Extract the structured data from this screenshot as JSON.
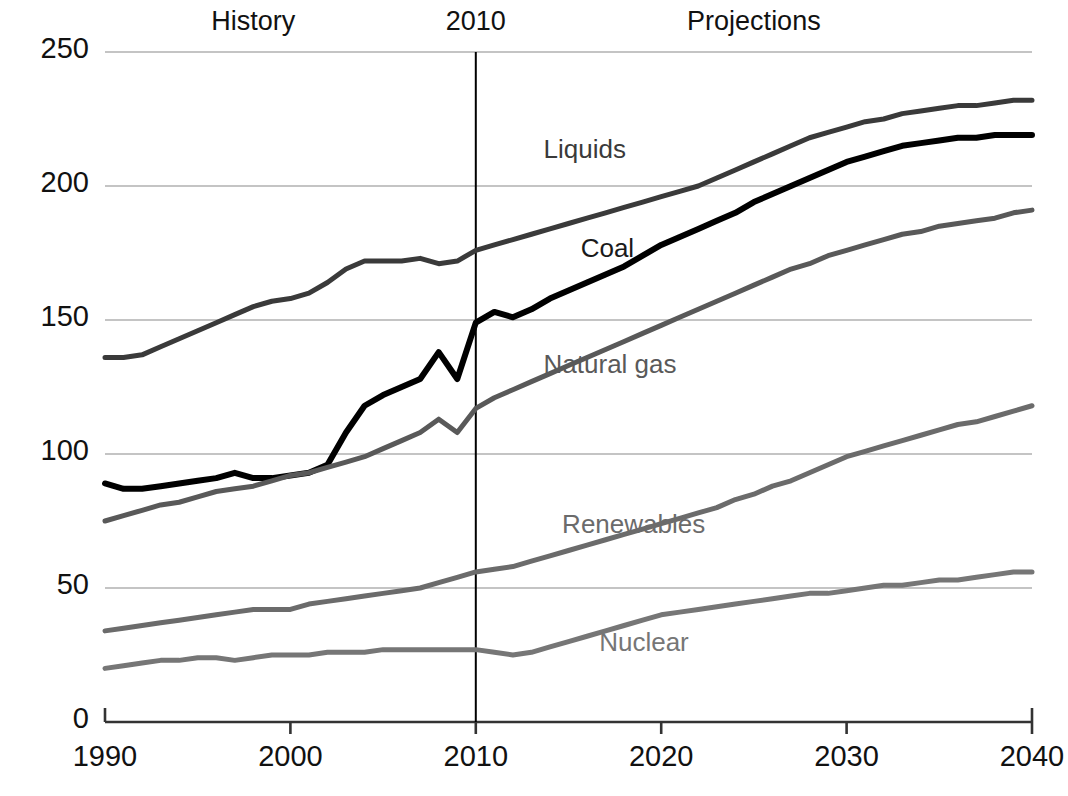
{
  "chart_data": {
    "type": "line",
    "title": "",
    "xlabel": "",
    "ylabel": "",
    "xlim": [
      1990,
      2040
    ],
    "ylim": [
      0,
      250
    ],
    "grid": true,
    "legend_position": "inline-labels",
    "xticks": [
      "1990",
      "2000",
      "2010",
      "2020",
      "2030",
      "2040"
    ],
    "yticks": [
      "0",
      "50",
      "100",
      "150",
      "200",
      "250"
    ],
    "annotations": [
      {
        "name": "history",
        "text": "History",
        "x": 1998
      },
      {
        "name": "divider-year",
        "text": "2010",
        "x": 2010
      },
      {
        "name": "projections",
        "text": "Projections",
        "x": 2025
      }
    ],
    "divider_x": 2010,
    "x": [
      1990,
      1991,
      1992,
      1993,
      1994,
      1995,
      1996,
      1997,
      1998,
      1999,
      2000,
      2001,
      2002,
      2003,
      2004,
      2005,
      2006,
      2007,
      2008,
      2009,
      2010,
      2011,
      2012,
      2013,
      2014,
      2015,
      2016,
      2017,
      2018,
      2019,
      2020,
      2021,
      2022,
      2023,
      2024,
      2025,
      2026,
      2027,
      2028,
      2029,
      2030,
      2031,
      2032,
      2033,
      2034,
      2035,
      2036,
      2037,
      2038,
      2039,
      2040
    ],
    "series": [
      {
        "name": "Liquids",
        "color": "#3a3a3a",
        "width": 5,
        "label_x": 2017,
        "label_y": 213,
        "values": [
          136,
          136,
          137,
          140,
          143,
          146,
          149,
          152,
          155,
          157,
          158,
          160,
          164,
          169,
          172,
          172,
          172,
          173,
          171,
          172,
          176,
          178,
          180,
          182,
          184,
          186,
          188,
          190,
          192,
          194,
          196,
          198,
          200,
          203,
          206,
          209,
          212,
          215,
          218,
          220,
          222,
          224,
          225,
          227,
          228,
          229,
          230,
          230,
          231,
          232,
          232
        ]
      },
      {
        "name": "Coal",
        "color": "#000000",
        "width": 6,
        "label_x": 2019,
        "label_y": 176,
        "values": [
          89,
          87,
          87,
          88,
          89,
          90,
          91,
          93,
          91,
          91,
          92,
          93,
          96,
          108,
          118,
          122,
          125,
          128,
          138,
          128,
          149,
          153,
          151,
          154,
          158,
          161,
          164,
          167,
          170,
          174,
          178,
          181,
          184,
          187,
          190,
          194,
          197,
          200,
          203,
          206,
          209,
          211,
          213,
          215,
          216,
          217,
          218,
          218,
          219,
          219,
          219
        ]
      },
      {
        "name": "Natural gas",
        "color": "#595959",
        "width": 5,
        "label_x": 2017,
        "label_y": 133,
        "values": [
          75,
          77,
          79,
          81,
          82,
          84,
          86,
          87,
          88,
          90,
          92,
          93,
          95,
          97,
          99,
          102,
          105,
          108,
          113,
          108,
          117,
          121,
          124,
          127,
          130,
          133,
          136,
          139,
          142,
          145,
          148,
          151,
          154,
          157,
          160,
          163,
          166,
          169,
          171,
          174,
          176,
          178,
          180,
          182,
          183,
          185,
          186,
          187,
          188,
          190,
          191
        ]
      },
      {
        "name": "Renewables",
        "color": "#6b6b6b",
        "width": 5,
        "label_x": 2018,
        "label_y": 73,
        "values": [
          34,
          35,
          36,
          37,
          38,
          39,
          40,
          41,
          42,
          42,
          42,
          44,
          45,
          46,
          47,
          48,
          49,
          50,
          52,
          54,
          56,
          57,
          58,
          60,
          62,
          64,
          66,
          68,
          70,
          72,
          74,
          76,
          78,
          80,
          83,
          85,
          88,
          90,
          93,
          96,
          99,
          101,
          103,
          105,
          107,
          109,
          111,
          112,
          114,
          116,
          118
        ]
      },
      {
        "name": "Nuclear",
        "color": "#767676",
        "width": 5,
        "label_x": 2020,
        "label_y": 29,
        "values": [
          20,
          21,
          22,
          23,
          23,
          24,
          24,
          23,
          24,
          25,
          25,
          25,
          26,
          26,
          26,
          27,
          27,
          27,
          27,
          27,
          27,
          26,
          25,
          26,
          28,
          30,
          32,
          34,
          36,
          38,
          40,
          41,
          42,
          43,
          44,
          45,
          46,
          47,
          48,
          48,
          49,
          50,
          51,
          51,
          52,
          53,
          53,
          54,
          55,
          56,
          56
        ]
      }
    ]
  },
  "axis": {
    "axis_color": "#333333",
    "grid_color": "#b0b0b0",
    "divider_color": "#000000"
  }
}
